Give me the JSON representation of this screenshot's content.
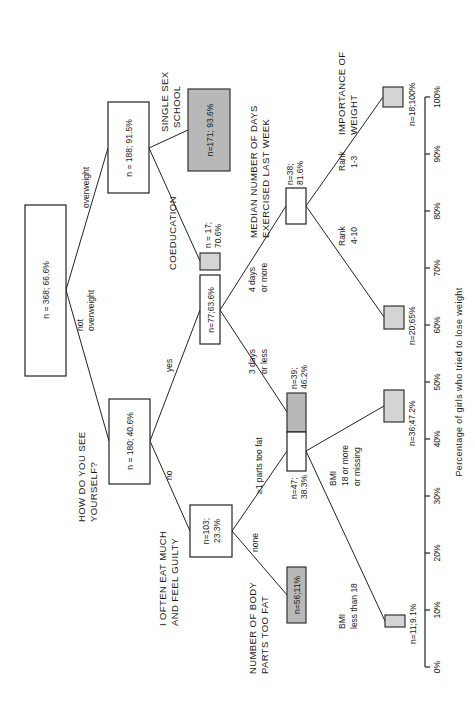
{
  "diagram": {
    "type": "decision-tree",
    "orientation": "rotated-90-ccw",
    "nodes": {
      "root": {
        "label": "n = 368;  66.6%"
      },
      "overweight": {
        "label": "n = 188;  91.5%"
      },
      "single_sex": {
        "label": "n=171;  93.6%"
      },
      "not_overweight": {
        "label": "n = 180;  40.6%"
      },
      "no_guilt": {
        "label_line1": "n=103;",
        "label_line2": "23.3%"
      },
      "coeducation": {
        "label_line1": "n = 17;",
        "label_line2": "70.6%"
      },
      "yes_guilt": {
        "label": "n=77;63.6%"
      },
      "days_3_less": {
        "label_line1": "n=39;",
        "label_line2": "46.2%"
      },
      "parts_ge1": {
        "label_line1": "n=47;",
        "label_line2": "38.3%"
      },
      "days_4_more": {
        "label_line1": "n=38;",
        "label_line2": "81.6%"
      },
      "parts_none": {
        "label": "n=56;11%"
      },
      "bmi_lt18": {
        "label": "n=11;9.1%"
      },
      "bmi_ge18": {
        "label": "n=36;47.2%"
      },
      "rank_4_10": {
        "label": "n=20;65%"
      },
      "rank_1_3": {
        "label": "n=18;100%"
      }
    },
    "questions": {
      "how_see": {
        "line1": "HOW DO YOU SEE",
        "line2": "YOURSELF?"
      },
      "eat_guilty": {
        "line1": "I OFTEN EAT MUCH",
        "line2": "AND FEEL GUILTY"
      },
      "body_parts": {
        "line1": "NUMBER OF BODY",
        "line2": "PARTS TOO FAT"
      },
      "exercise": {
        "line1": "MEDIAN NUMBER OF DAYS",
        "line2": "EXERCISED LAST WEEK"
      },
      "importance": {
        "line1": "IMPORTANCE OF",
        "line2": "WEIGHT"
      },
      "single_sex": {
        "line1": "SINGLE SEX",
        "line2": "SCHOOL"
      },
      "coeducation": "COEDUCATION"
    },
    "edge_labels": {
      "overweight": "overweight",
      "not_overweight_1": "not",
      "not_overweight_2": "overweight",
      "yes": "yes",
      "no": "no",
      "none": "none",
      "ge1_parts": "≥1 parts too fat",
      "days_3_1": "3 days",
      "days_3_2": "or less",
      "days_4_1": "4 days",
      "days_4_2": "or more",
      "bmi_lt_1": "BMI",
      "bmi_lt_2": "less than 18",
      "bmi_ge_1": "BMI",
      "bmi_ge_2": "18 or more",
      "bmi_ge_3": "or missing",
      "rank_410_1": "Rank",
      "rank_410_2": "4-10",
      "rank_13_1": "Rank",
      "rank_13_2": "1-3"
    },
    "axis": {
      "title": "Percentage of girls who tried to lose weight",
      "ticks": [
        "0%",
        "10%",
        "20%",
        "30%",
        "40%",
        "50%",
        "60%",
        "70%",
        "80%",
        "90%",
        "100%"
      ]
    }
  }
}
